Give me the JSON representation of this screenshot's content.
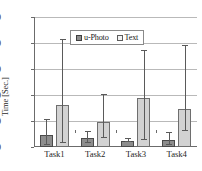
{
  "chart_data": {
    "type": "bar",
    "title": "",
    "xlabel": "",
    "ylabel": "Time [Sec.]",
    "categories": [
      "Task1",
      "Task2",
      "Task3",
      "Task4"
    ],
    "ylim": [
      0,
      250
    ],
    "yticks": [
      0,
      50,
      100,
      150,
      200,
      250
    ],
    "grid": true,
    "legend_position": "top-center",
    "series": [
      {
        "name": "u-Photo",
        "color": "#8d8d8d",
        "values": [
          23,
          18,
          12,
          13
        ],
        "err_low": [
          4,
          8,
          9,
          4
        ],
        "err_high": [
          52,
          28,
          16,
          26
        ]
      },
      {
        "name": "Text",
        "color": "#d2d2d2",
        "values": [
          81,
          49,
          95,
          74
        ],
        "err_low": [
          8,
          17,
          13,
          31
        ],
        "err_high": [
          205,
          100,
          185,
          194
        ]
      }
    ]
  },
  "axis": {
    "y_tick_labels": [
      "0",
      "50",
      "100",
      "150",
      "200",
      "250"
    ],
    "y_title": "Time [Sec.]"
  },
  "legend": {
    "entries": [
      {
        "label": "u-Photo",
        "marker": "filled-square-dark"
      },
      {
        "label": "Text",
        "marker": "open-square-light"
      }
    ]
  }
}
